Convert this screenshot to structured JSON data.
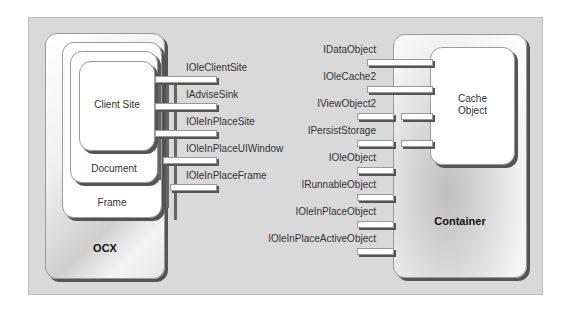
{
  "diagram": {
    "left_component": {
      "outer_label": "OCX",
      "nested": [
        {
          "label": "Frame"
        },
        {
          "label": "Document"
        },
        {
          "label": "Client Site"
        }
      ],
      "interfaces": [
        "IOleClientSite",
        "IAdviseSink",
        "IOleInPlaceSite",
        "IOleInPlaceUIWindow",
        "IOleInPlaceFrame"
      ]
    },
    "right_component": {
      "outer_label": "Container",
      "inner_label": "Cache\nObject",
      "inner_label_line1": "Cache",
      "inner_label_line2": "Object",
      "interfaces": [
        "IDataObject",
        "IOleCache2",
        "IViewObject2",
        "IPersistStorage",
        "IOleObject",
        "IRunnableObject",
        "IOleInPlaceObject",
        "IOleInPlaceActiveObject"
      ]
    },
    "colors": {
      "panel_bg": "#d9d9d9",
      "box_fill": "#ffffff",
      "shadow": "#555555",
      "text": "#333333"
    }
  }
}
